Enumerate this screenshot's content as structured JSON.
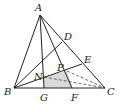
{
  "diagram": {
    "type": "geometry-triangle",
    "points": {
      "A": {
        "label": "A",
        "x": 40,
        "y": 15,
        "lx": 35,
        "ly": 11
      },
      "B": {
        "label": "B",
        "x": 14,
        "y": 88,
        "lx": 4,
        "ly": 95
      },
      "C": {
        "label": "C",
        "x": 105,
        "y": 88,
        "lx": 107,
        "ly": 95
      },
      "D": {
        "label": "D",
        "x": 62,
        "y": 42,
        "lx": 64,
        "ly": 40
      },
      "E": {
        "label": "E",
        "x": 82,
        "y": 64,
        "lx": 84,
        "ly": 63
      },
      "G": {
        "label": "G",
        "x": 44,
        "y": 88,
        "lx": 40,
        "ly": 101
      },
      "F": {
        "label": "F",
        "x": 72,
        "y": 88,
        "lx": 71,
        "ly": 101
      },
      "N": {
        "label": "N",
        "x": 44,
        "y": 77,
        "lx": 34,
        "ly": 80
      },
      "P": {
        "label": "P",
        "x": 67,
        "y": 71,
        "lx": 57,
        "ly": 71
      }
    },
    "solid_segments": [
      [
        "A",
        "B"
      ],
      [
        "B",
        "C"
      ],
      [
        "A",
        "C"
      ],
      [
        "A",
        "G"
      ],
      [
        "A",
        "F"
      ],
      [
        "B",
        "D"
      ],
      [
        "B",
        "E"
      ]
    ],
    "dashed_segments": [
      [
        "N",
        "C"
      ],
      [
        "P",
        "C"
      ]
    ],
    "shaded_region": [
      "N",
      "P",
      "F",
      "G"
    ],
    "colors": {
      "line": "#222222",
      "shade": "#d9d9d9",
      "background": "#ffffff"
    }
  }
}
